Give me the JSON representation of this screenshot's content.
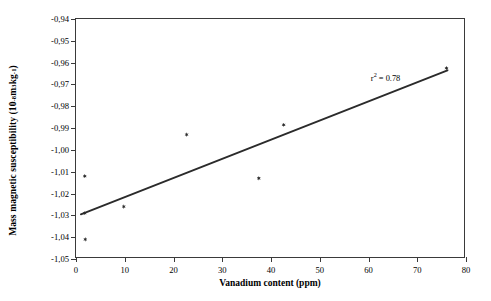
{
  "chart_data": {
    "type": "scatter",
    "title": "",
    "xlabel": "Vanadium content (ppm)",
    "ylabel_text": "Mass magnetic susceptibility (10",
    "ylabel_exp1": "-8",
    "ylabel_mid": " m",
    "ylabel_exp2": "3",
    "ylabel_mid2": "kg",
    "ylabel_exp3": "-1",
    "ylabel_end": ")",
    "xlim": [
      0,
      80
    ],
    "ylim": [
      -1.05,
      -0.94
    ],
    "xticks": [
      0,
      10,
      20,
      30,
      40,
      50,
      60,
      70,
      80
    ],
    "xtick_labels": [
      "0",
      "10",
      "20",
      "30",
      "40",
      "50",
      "60",
      "70",
      "80"
    ],
    "yticks": [
      -0.94,
      -0.95,
      -0.96,
      -0.97,
      -0.98,
      -0.99,
      -1.0,
      -1.01,
      -1.02,
      -1.03,
      -1.04,
      -1.05
    ],
    "ytick_labels": [
      "-0,94",
      "-0,95",
      "-0,96",
      "-0,97",
      "-0,98",
      "-0,99",
      "-1,00",
      "-1,01",
      "-1,02",
      "-1,03",
      "-1,04",
      "-1,05"
    ],
    "grid": false,
    "legend": false,
    "marker_color": "#2b2b2b",
    "line_color": "#2b2b2b",
    "axis_color": "#3a3a3a",
    "points": [
      {
        "x": 1.8,
        "y": -1.012
      },
      {
        "x": 1.8,
        "y": -1.029
      },
      {
        "x": 1.9,
        "y": -1.041
      },
      {
        "x": 9.8,
        "y": -1.026
      },
      {
        "x": 22.7,
        "y": -0.993
      },
      {
        "x": 37.5,
        "y": -1.013
      },
      {
        "x": 42.6,
        "y": -0.9885
      },
      {
        "x": 76.0,
        "y": -0.9625
      }
    ],
    "trendline": {
      "x0": 1.0,
      "y0": -1.0295,
      "x1": 76.2,
      "y1": -0.9635
    },
    "annotations": [
      {
        "name": "r-squared",
        "text_prefix": "r",
        "text_sup": "2",
        "text_suffix": " = 0.78",
        "x": 63.5,
        "y": -0.9665
      }
    ]
  }
}
